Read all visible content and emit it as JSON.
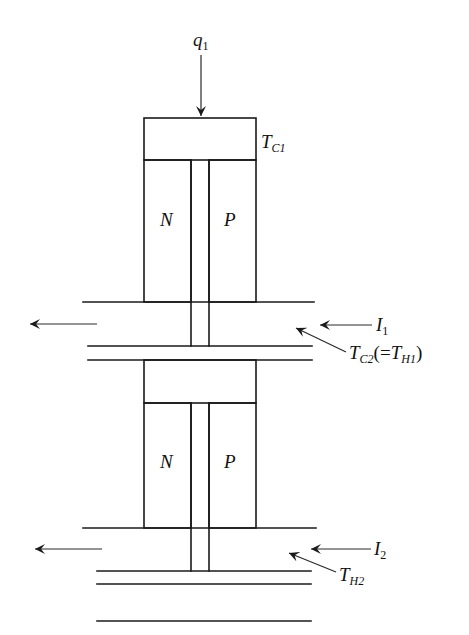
{
  "diagram": {
    "colors": {
      "line": "#1a1a1a",
      "background": "#ffffff"
    },
    "labels": {
      "heat_input": {
        "main": "q",
        "sub": "1"
      },
      "cold_temp_stage1": {
        "main": "T",
        "sub": "C1"
      },
      "stage1_n_leg": "N",
      "stage1_p_leg": "P",
      "current_1": {
        "main": "I",
        "sub": "1"
      },
      "interface_temp": {
        "main": "T",
        "sub": "C2",
        "paren_open": "(=",
        "main2": "T",
        "sub2": "H1",
        "paren_close": ")"
      },
      "stage2_n_leg": "N",
      "stage2_p_leg": "P",
      "current_2": {
        "main": "I",
        "sub": "2"
      },
      "hot_temp_stage2": {
        "main": "T",
        "sub": "H2"
      }
    }
  }
}
